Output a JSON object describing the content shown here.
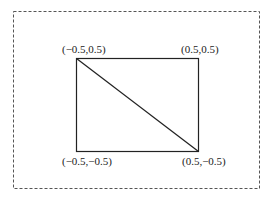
{
  "diagram": {
    "type": "unit-square-with-diagonal",
    "frame": {
      "style": "dashed",
      "color": "#555555"
    },
    "square": {
      "stroke": "#222222"
    },
    "diagonal": {
      "from": "top-left",
      "to": "bottom-right",
      "stroke": "#222222"
    },
    "labels": {
      "top_left": "(−0.5,0.5)",
      "top_right": "(0.5,0.5)",
      "bottom_left": "(−0.5,−0.5)",
      "bottom_right": "(0.5,−0.5)"
    }
  }
}
